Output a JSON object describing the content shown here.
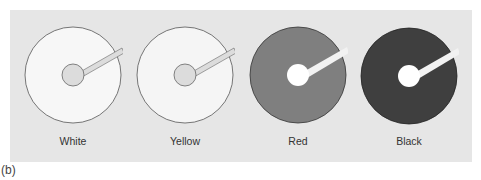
{
  "figure": {
    "caption": "(b)",
    "panel_color": "#e6e6e6",
    "disks": [
      {
        "label": "White",
        "fill": "#f7f7f7",
        "hub": "#dcdcdc",
        "slot": "#dcdcdc",
        "cx": 73
      },
      {
        "label": "Yellow",
        "fill": "#f5f5f5",
        "hub": "#dcdcdc",
        "slot": "#dcdcdc",
        "cx": 185
      },
      {
        "label": "Red",
        "fill": "#7f7f7f",
        "hub": "#ffffff",
        "slot": "#f2f2f2",
        "cx": 298
      },
      {
        "label": "Black",
        "fill": "#3f3f3f",
        "hub": "#ffffff",
        "slot": "#f2f2f2",
        "cx": 409
      }
    ]
  }
}
